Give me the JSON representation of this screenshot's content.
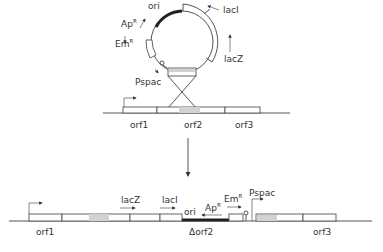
{
  "diagram": {
    "type": "plasmid integration schematic",
    "top": {
      "plasmid_labels": {
        "ori": "ori",
        "apr": "Ap",
        "apr_sup": "R",
        "emr": "Em",
        "emr_sup": "R",
        "laci": "lacI",
        "lacz": "lacZ",
        "pspac": "Pspac"
      },
      "chromosome_genes": [
        "orf1",
        "orf2",
        "orf3"
      ]
    },
    "bottom": {
      "gene_labels": {
        "orf1": "orf1",
        "lacz": "lacZ",
        "laci": "lacI",
        "ori": "ori",
        "apr": "Ap",
        "apr_sup": "R",
        "emr": "Em",
        "emr_sup": "R",
        "pspac": "Pspac",
        "dorf2": "Δorf2",
        "orf3": "orf3"
      }
    },
    "colors": {
      "line": "#555555",
      "marker": "#222222",
      "homology_shade": "#d2d2d2"
    }
  }
}
